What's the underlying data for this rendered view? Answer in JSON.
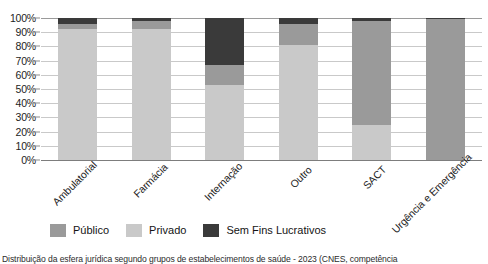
{
  "chart_data": {
    "type": "bar",
    "subtype": "stacked-100-percent",
    "title": "",
    "xlabel": "",
    "ylabel": "",
    "ylim": [
      0,
      100
    ],
    "ytick_labels": [
      "100%",
      "90%",
      "80%",
      "70%",
      "60%",
      "50%",
      "40%",
      "30%",
      "20%",
      "10%",
      "0%"
    ],
    "ytick_values": [
      100,
      90,
      80,
      70,
      60,
      50,
      40,
      30,
      20,
      10,
      0
    ],
    "grid": true,
    "legend_position": "bottom",
    "categories": [
      "Ambulatorial",
      "Farmácia",
      "Internação",
      "Outro",
      "SACT",
      "Urgência e Emergência"
    ],
    "series": [
      {
        "name": "Público",
        "color": "#9a9a9a",
        "values": [
          4,
          6,
          14,
          15,
          73,
          99
        ]
      },
      {
        "name": "Privado",
        "color": "#c9c9c9",
        "values": [
          92,
          92,
          53,
          81,
          25,
          0
        ]
      },
      {
        "name": "Sem Fins Lucrativos",
        "color": "#3a3a3a",
        "values": [
          4,
          2,
          33,
          4,
          2,
          1
        ]
      }
    ]
  },
  "legend": {
    "items": [
      {
        "label": "Público",
        "color": "#9a9a9a"
      },
      {
        "label": "Privado",
        "color": "#c9c9c9"
      },
      {
        "label": "Sem  Fins Lucrativos",
        "color": "#3a3a3a"
      }
    ]
  },
  "caption": {
    "text": "Distribuição da esfera jurídica segundo grupos de estabelecimentos de saúde - 2023 (CNES, competência"
  }
}
